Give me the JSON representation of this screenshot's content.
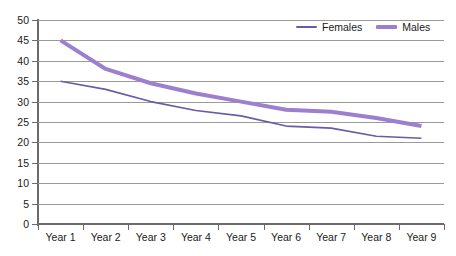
{
  "chart_data": {
    "type": "line",
    "title": "",
    "subtitle": "",
    "xlabel": "",
    "ylabel": "",
    "categories": [
      "Year 1",
      "Year 2",
      "Year 3",
      "Year 4",
      "Year 5",
      "Year 6",
      "Year 7",
      "Year 8",
      "Year 9"
    ],
    "series": [
      {
        "name": "Females",
        "color": "#6b5aa8",
        "line_width": 1.6,
        "values": [
          35,
          33,
          30,
          27.8,
          26.5,
          24,
          23.5,
          21.5,
          21
        ]
      },
      {
        "name": "Males",
        "color": "#9d7fcf",
        "line_width": 4,
        "values": [
          45,
          38,
          34.5,
          32,
          30,
          28,
          27.5,
          26,
          24
        ]
      }
    ],
    "ylim": [
      0,
      50
    ],
    "y_ticks": [
      0,
      5,
      10,
      15,
      20,
      25,
      30,
      35,
      40,
      45,
      50
    ],
    "y_tick_labels": [
      "0",
      "5",
      "10",
      "15",
      "20",
      "25",
      "30",
      "35",
      "40",
      "45",
      "50"
    ],
    "grid": true,
    "grid_axis": "y",
    "legend_position": "top-right",
    "legend": [
      "Females",
      "Males"
    ],
    "annotations": []
  },
  "legend": {
    "females_label": "Females",
    "males_label": "Males"
  },
  "colors": {
    "females": "#6b5aa8",
    "males": "#9d7fcf",
    "gridline": "#9a9a9a",
    "axis": "#6b6b6b",
    "background": "#ffffff",
    "text": "#1a1a1a"
  }
}
